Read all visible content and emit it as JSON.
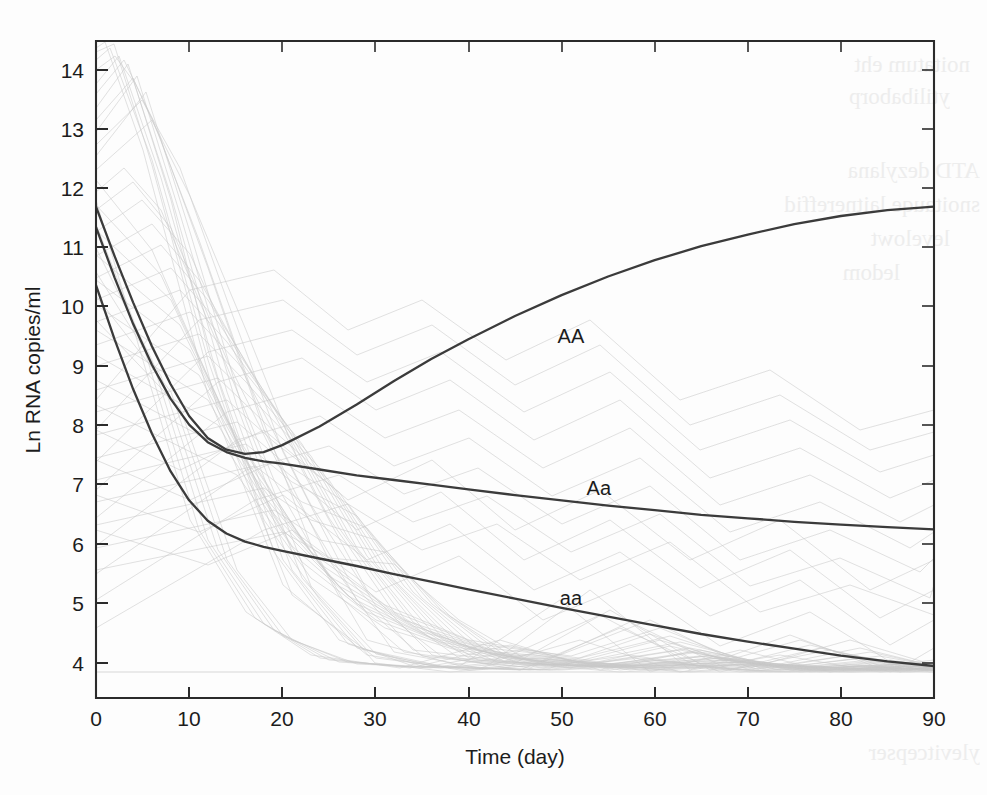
{
  "figure": {
    "background_color": "#fdfdfd",
    "axis_color": "#2b2b2b",
    "curve_color": "#3b3b3b",
    "spaghetti_color": "#c9c9c9",
    "scan_artifact_note": "faint mirrored bleed-through text from reverse of scanned page"
  },
  "chart_data": {
    "type": "line",
    "title": "",
    "xlabel": "Time (day)",
    "ylabel": "Ln RNA copies/ml",
    "xlim": [
      0,
      90
    ],
    "ylim": [
      3.55,
      14.85
    ],
    "xticks": [
      0,
      10,
      20,
      30,
      40,
      50,
      60,
      70,
      80,
      90
    ],
    "xticklabels": [
      "0",
      "10",
      "20",
      "30",
      "40",
      "50",
      "60",
      "70",
      "80",
      "90"
    ],
    "yticks": [
      4,
      5,
      6,
      7,
      8,
      9,
      10,
      11,
      12,
      13,
      14
    ],
    "yticklabels": [
      "4",
      "5",
      "6",
      "7",
      "8",
      "9",
      "10",
      "11",
      "12",
      "13",
      "14"
    ],
    "grid": false,
    "legend_position": "inline-annotation",
    "detection_floor": 3.85,
    "annotations": [
      {
        "text": "AA",
        "x": 51,
        "y": 9.65
      },
      {
        "text": "Aa",
        "x": 54,
        "y": 7.05
      },
      {
        "text": "aa",
        "x": 51,
        "y": 5.15
      }
    ],
    "series": [
      {
        "name": "AA",
        "label": "AA",
        "style": "solid-dark",
        "x": [
          0,
          2,
          4,
          6,
          8,
          10,
          12,
          14,
          16,
          18,
          20,
          24,
          28,
          32,
          36,
          40,
          45,
          50,
          55,
          60,
          65,
          70,
          75,
          80,
          85,
          90
        ],
        "y": [
          12.0,
          11.15,
          10.35,
          9.6,
          8.95,
          8.4,
          8.02,
          7.82,
          7.75,
          7.78,
          7.9,
          8.22,
          8.6,
          9.0,
          9.38,
          9.72,
          10.12,
          10.48,
          10.8,
          11.08,
          11.32,
          11.52,
          11.7,
          11.84,
          11.94,
          12.0
        ]
      },
      {
        "name": "Aa",
        "label": "Aa",
        "style": "solid-dark",
        "x": [
          0,
          2,
          4,
          6,
          8,
          10,
          12,
          14,
          16,
          18,
          20,
          24,
          28,
          32,
          36,
          40,
          45,
          50,
          55,
          60,
          65,
          70,
          75,
          80,
          85,
          90
        ],
        "y": [
          11.65,
          10.78,
          9.98,
          9.28,
          8.7,
          8.25,
          7.95,
          7.78,
          7.68,
          7.62,
          7.58,
          7.48,
          7.38,
          7.3,
          7.22,
          7.14,
          7.04,
          6.95,
          6.86,
          6.78,
          6.7,
          6.64,
          6.58,
          6.53,
          6.49,
          6.45
        ]
      },
      {
        "name": "aa",
        "label": "aa",
        "style": "solid-dark",
        "x": [
          0,
          2,
          4,
          6,
          8,
          10,
          12,
          14,
          16,
          18,
          20,
          24,
          28,
          32,
          36,
          40,
          45,
          50,
          55,
          60,
          65,
          70,
          75,
          80,
          85,
          90
        ],
        "y": [
          10.65,
          9.72,
          8.86,
          8.1,
          7.45,
          6.95,
          6.6,
          6.38,
          6.24,
          6.15,
          6.08,
          5.95,
          5.82,
          5.68,
          5.55,
          5.42,
          5.26,
          5.1,
          4.95,
          4.8,
          4.65,
          4.52,
          4.4,
          4.28,
          4.18,
          4.1
        ]
      }
    ],
    "background_trajectories_note": "≈60 faint individual-patient viral-load trajectories underlay the three fitted genotype curves"
  }
}
